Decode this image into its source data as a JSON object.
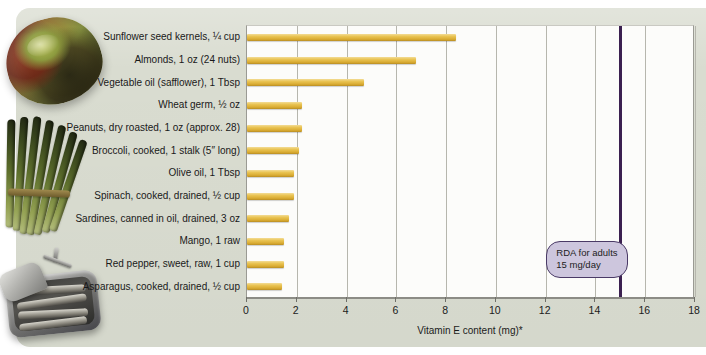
{
  "chart_data": {
    "type": "bar",
    "orientation": "horizontal",
    "title": "",
    "xlabel": "Vitamin E content (mg)*",
    "ylabel": "",
    "xlim": [
      0,
      18
    ],
    "xticks": [
      0,
      2,
      4,
      6,
      8,
      10,
      12,
      14,
      16,
      18
    ],
    "xtick_labels": [
      "0",
      "2",
      "4",
      "6",
      "8",
      "10",
      "12",
      "14",
      "16",
      "18"
    ],
    "grid": true,
    "grid_axis": "x",
    "legend": "none",
    "categories": [
      "Sunflower seed kernels, ¼ cup",
      "Almonds, 1 oz (24 nuts)",
      "Vegetable oil (safflower), 1 Tbsp",
      "Wheat germ, ½ oz",
      "Peanuts, dry roasted, 1 oz (approx. 28)",
      "Broccoli, cooked, 1 stalk (5″ long)",
      "Olive oil, 1 Tbsp",
      "Spinach, cooked, drained, ½ cup",
      "Sardines, canned in oil, drained, 3 oz",
      "Mango, 1 raw",
      "Red pepper, sweet, raw, 1 cup",
      "Asparagus, cooked, drained, ½ cup"
    ],
    "values": [
      8.4,
      6.8,
      4.7,
      2.2,
      2.2,
      2.1,
      1.9,
      1.9,
      1.7,
      1.5,
      1.5,
      1.4
    ],
    "annotations": [
      {
        "type": "vline",
        "value": 15,
        "color": "#3b2050",
        "label_line1": "RDA for adults",
        "label_line2": "15 mg/day"
      }
    ],
    "bar_color": "#e9c352",
    "plot_background": "#fcfcfa",
    "page_background": "#d9dcd0"
  },
  "photos": [
    {
      "name": "mango-photo",
      "alt": "Mango"
    },
    {
      "name": "asparagus-photo",
      "alt": "Bundle of asparagus spears"
    },
    {
      "name": "sardines-photo",
      "alt": "Open tin of sardines"
    }
  ]
}
